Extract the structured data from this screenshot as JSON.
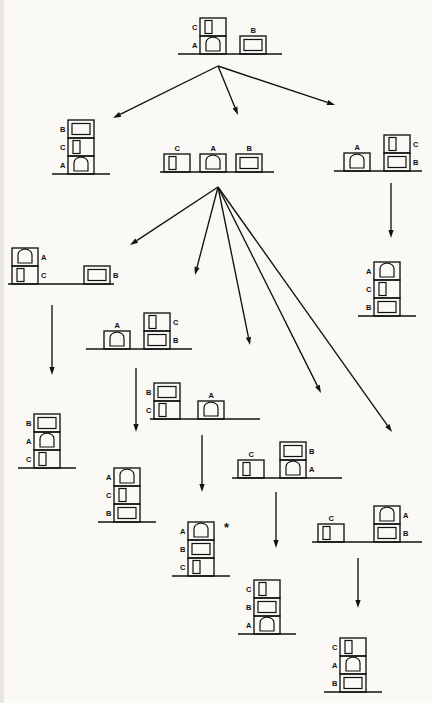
{
  "diagram": {
    "type": "state-space-search-tree",
    "goal_marker": "*",
    "block_labels": [
      "A",
      "B",
      "C"
    ],
    "block_kinds": {
      "A": "arch-block",
      "B": "wide-block",
      "C": "tall-block"
    },
    "colors": {
      "stroke": "#111111",
      "background": "#faf9f6"
    }
  },
  "nodes": [
    {
      "id": "n0",
      "name": "root-state",
      "depth": 0,
      "x": 178,
      "y": 8,
      "w": 105,
      "h": 52,
      "table_w": 104,
      "starred": false,
      "stacks": [
        {
          "left": 22,
          "blocks": [
            {
              "label": "A",
              "kind": "A",
              "label_side": "left"
            },
            {
              "label": "C",
              "kind": "C",
              "label_side": "left"
            }
          ]
        },
        {
          "left": 62,
          "blocks": [
            {
              "label": "B",
              "kind": "B",
              "label_side": "top"
            }
          ]
        }
      ]
    },
    {
      "id": "n1",
      "name": "state-BCA-stack",
      "depth": 1,
      "x": 52,
      "y": 98,
      "w": 60,
      "h": 82,
      "table_w": 58,
      "starred": false,
      "stacks": [
        {
          "left": 16,
          "blocks": [
            {
              "label": "A",
              "kind": "A",
              "label_side": "left"
            },
            {
              "label": "C",
              "kind": "C",
              "label_side": "left"
            },
            {
              "label": "B",
              "kind": "B",
              "label_side": "left"
            }
          ]
        }
      ]
    },
    {
      "id": "n2",
      "name": "state-all-on-table",
      "depth": 1,
      "x": 160,
      "y": 128,
      "w": 115,
      "h": 50,
      "table_w": 114,
      "starred": false,
      "stacks": [
        {
          "left": 4,
          "blocks": [
            {
              "label": "C",
              "kind": "C",
              "label_side": "top"
            }
          ]
        },
        {
          "left": 40,
          "blocks": [
            {
              "label": "A",
              "kind": "A",
              "label_side": "top"
            }
          ]
        },
        {
          "left": 76,
          "blocks": [
            {
              "label": "B",
              "kind": "B",
              "label_side": "top"
            }
          ]
        }
      ]
    },
    {
      "id": "n3",
      "name": "state-A-table-CB-stack",
      "depth": 1,
      "x": 334,
      "y": 122,
      "w": 90,
      "h": 55,
      "table_w": 88,
      "starred": false,
      "stacks": [
        {
          "left": 10,
          "blocks": [
            {
              "label": "A",
              "kind": "A",
              "label_side": "top"
            }
          ]
        },
        {
          "left": 50,
          "blocks": [
            {
              "label": "B",
              "kind": "B",
              "label_side": "right"
            },
            {
              "label": "C",
              "kind": "C",
              "label_side": "right"
            }
          ]
        }
      ]
    },
    {
      "id": "n4",
      "name": "state-AC-stack-B-table",
      "depth": 2,
      "x": 8,
      "y": 238,
      "w": 108,
      "h": 52,
      "table_w": 106,
      "starred": false,
      "stacks": [
        {
          "left": 4,
          "blocks": [
            {
              "label": "C",
              "kind": "C",
              "label_side": "right"
            },
            {
              "label": "A",
              "kind": "A",
              "label_side": "right"
            }
          ]
        },
        {
          "left": 76,
          "blocks": [
            {
              "label": "B",
              "kind": "B",
              "label_side": "right"
            }
          ]
        }
      ]
    },
    {
      "id": "n5",
      "name": "state-A-table-BC-stack",
      "depth": 2,
      "x": 86,
      "y": 300,
      "w": 108,
      "h": 55,
      "table_w": 106,
      "starred": false,
      "stacks": [
        {
          "left": 18,
          "blocks": [
            {
              "label": "A",
              "kind": "A",
              "label_side": "top"
            }
          ]
        },
        {
          "left": 58,
          "blocks": [
            {
              "label": "B",
              "kind": "B",
              "label_side": "right"
            },
            {
              "label": "C",
              "kind": "C",
              "label_side": "right"
            }
          ]
        }
      ]
    },
    {
      "id": "n6",
      "name": "state-CB-stack-A-table",
      "depth": 2,
      "x": 150,
      "y": 370,
      "w": 112,
      "h": 55,
      "table_w": 110,
      "starred": false,
      "stacks": [
        {
          "left": 4,
          "blocks": [
            {
              "label": "C",
              "kind": "C",
              "label_side": "left"
            },
            {
              "label": "B",
              "kind": "B",
              "label_side": "left"
            }
          ]
        },
        {
          "left": 48,
          "blocks": [
            {
              "label": "A",
              "kind": "A",
              "label_side": "top"
            }
          ]
        }
      ]
    },
    {
      "id": "n7",
      "name": "state-C-table-AB-stack",
      "depth": 2,
      "x": 232,
      "y": 428,
      "w": 112,
      "h": 56,
      "table_w": 110,
      "starred": false,
      "stacks": [
        {
          "left": 6,
          "blocks": [
            {
              "label": "C",
              "kind": "C",
              "label_side": "top"
            }
          ]
        },
        {
          "left": 48,
          "blocks": [
            {
              "label": "A",
              "kind": "A",
              "label_side": "right"
            },
            {
              "label": "B",
              "kind": "B",
              "label_side": "right"
            }
          ]
        }
      ]
    },
    {
      "id": "n8",
      "name": "state-C-table-BA-stack",
      "depth": 2,
      "x": 312,
      "y": 492,
      "w": 112,
      "h": 56,
      "table_w": 110,
      "starred": false,
      "stacks": [
        {
          "left": 6,
          "blocks": [
            {
              "label": "C",
              "kind": "C",
              "label_side": "top"
            }
          ]
        },
        {
          "left": 62,
          "blocks": [
            {
              "label": "B",
              "kind": "B",
              "label_side": "right"
            },
            {
              "label": "A",
              "kind": "A",
              "label_side": "right"
            }
          ]
        }
      ]
    },
    {
      "id": "n9",
      "name": "state-CAB-stack",
      "depth": 3,
      "x": 18,
      "y": 392,
      "w": 60,
      "h": 82,
      "table_w": 58,
      "starred": false,
      "stacks": [
        {
          "left": 16,
          "blocks": [
            {
              "label": "C",
              "kind": "C",
              "label_side": "left"
            },
            {
              "label": "A",
              "kind": "A",
              "label_side": "left"
            },
            {
              "label": "B",
              "kind": "B",
              "label_side": "left"
            }
          ]
        }
      ]
    },
    {
      "id": "n10",
      "name": "state-BCA-stack-2",
      "depth": 3,
      "x": 98,
      "y": 446,
      "w": 60,
      "h": 82,
      "table_w": 58,
      "starred": false,
      "stacks": [
        {
          "left": 16,
          "blocks": [
            {
              "label": "B",
              "kind": "B",
              "label_side": "left"
            },
            {
              "label": "C",
              "kind": "C",
              "label_side": "left"
            },
            {
              "label": "A",
              "kind": "A",
              "label_side": "left"
            }
          ]
        }
      ]
    },
    {
      "id": "n11",
      "name": "goal-state-CBA-stack",
      "depth": 3,
      "x": 172,
      "y": 500,
      "w": 60,
      "h": 82,
      "table_w": 58,
      "starred": true,
      "stacks": [
        {
          "left": 16,
          "blocks": [
            {
              "label": "C",
              "kind": "C",
              "label_side": "left"
            },
            {
              "label": "B",
              "kind": "B",
              "label_side": "left"
            },
            {
              "label": "A",
              "kind": "A",
              "label_side": "left"
            }
          ]
        }
      ]
    },
    {
      "id": "n12",
      "name": "state-ABC-stack",
      "depth": 3,
      "x": 238,
      "y": 558,
      "w": 60,
      "h": 82,
      "table_w": 58,
      "starred": false,
      "stacks": [
        {
          "left": 16,
          "blocks": [
            {
              "label": "A",
              "kind": "A",
              "label_side": "left"
            },
            {
              "label": "B",
              "kind": "B",
              "label_side": "left"
            },
            {
              "label": "C",
              "kind": "C",
              "label_side": "left"
            }
          ]
        }
      ]
    },
    {
      "id": "n13",
      "name": "state-BAC-stack",
      "depth": 3,
      "x": 324,
      "y": 614,
      "w": 60,
      "h": 84,
      "table_w": 58,
      "starred": false,
      "stacks": [
        {
          "left": 16,
          "blocks": [
            {
              "label": "B",
              "kind": "B",
              "label_side": "left"
            },
            {
              "label": "A",
              "kind": "A",
              "label_side": "left"
            },
            {
              "label": "C",
              "kind": "C",
              "label_side": "left"
            }
          ]
        }
      ]
    },
    {
      "id": "n14",
      "name": "state-ACB-stack",
      "depth": 2,
      "x": 358,
      "y": 240,
      "w": 60,
      "h": 82,
      "table_w": 58,
      "starred": false,
      "stacks": [
        {
          "left": 16,
          "blocks": [
            {
              "label": "B",
              "kind": "B",
              "label_side": "left"
            },
            {
              "label": "C",
              "kind": "C",
              "label_side": "left"
            },
            {
              "label": "A",
              "kind": "A",
              "label_side": "left"
            }
          ]
        }
      ]
    }
  ],
  "edges": [
    {
      "name": "edge-root-to-n1",
      "from": "n0",
      "to": "n1",
      "x1": 218,
      "y1": 66,
      "x2": 113,
      "y2": 118,
      "kind": "arrow"
    },
    {
      "name": "edge-root-to-n2",
      "from": "n0",
      "to": "n2",
      "x1": 218,
      "y1": 66,
      "x2": 238,
      "y2": 115,
      "kind": "arrow"
    },
    {
      "name": "edge-root-to-n3",
      "from": "n0",
      "to": "n3",
      "x1": 218,
      "y1": 66,
      "x2": 335,
      "y2": 105,
      "kind": "arrow"
    },
    {
      "name": "edge-n2-to-n4",
      "from": "n2",
      "to": "n4",
      "x1": 218,
      "y1": 187,
      "x2": 130,
      "y2": 245,
      "kind": "arrow"
    },
    {
      "name": "edge-n2-to-n5",
      "from": "n2",
      "to": "n5",
      "x1": 218,
      "y1": 187,
      "x2": 195,
      "y2": 275,
      "kind": "arrow"
    },
    {
      "name": "edge-n2-to-n6",
      "from": "n2",
      "to": "n6",
      "x1": 218,
      "y1": 187,
      "x2": 250,
      "y2": 345,
      "kind": "arrow"
    },
    {
      "name": "edge-n2-to-n7",
      "from": "n2",
      "to": "n7",
      "x1": 218,
      "y1": 187,
      "x2": 321,
      "y2": 393,
      "kind": "arrow"
    },
    {
      "name": "edge-n2-to-n8",
      "from": "n2",
      "to": "n8",
      "x1": 218,
      "y1": 187,
      "x2": 392,
      "y2": 432,
      "kind": "arrow"
    },
    {
      "name": "edge-n3-to-n14",
      "from": "n3",
      "to": "n14",
      "x1": 391,
      "y1": 183,
      "x2": 391,
      "y2": 238,
      "kind": "arrow"
    },
    {
      "name": "edge-n4-to-n9",
      "from": "n4",
      "to": "n9",
      "x1": 52,
      "y1": 305,
      "x2": 52,
      "y2": 375,
      "kind": "arrow"
    },
    {
      "name": "edge-n5-to-n10",
      "from": "n5",
      "to": "n10",
      "x1": 136,
      "y1": 368,
      "x2": 136,
      "y2": 432,
      "kind": "arrow"
    },
    {
      "name": "edge-n6-to-n11",
      "from": "n6",
      "to": "n11",
      "x1": 202,
      "y1": 435,
      "x2": 202,
      "y2": 492,
      "kind": "arrow"
    },
    {
      "name": "edge-n7-to-n12",
      "from": "n7",
      "to": "n12",
      "x1": 276,
      "y1": 492,
      "x2": 276,
      "y2": 548,
      "kind": "arrow"
    },
    {
      "name": "edge-n8-to-n13",
      "from": "n8",
      "to": "n13",
      "x1": 358,
      "y1": 558,
      "x2": 358,
      "y2": 608,
      "kind": "arrow"
    }
  ]
}
